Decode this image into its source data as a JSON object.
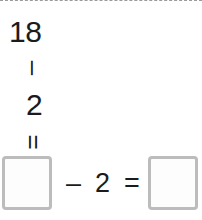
{
  "panel": {
    "title": "subtraction-exercise",
    "accent_color": "#bcbcbc",
    "text_color": "#1b1b1b",
    "divider_color": "#9a9a9a",
    "background_color": "#ffffff"
  },
  "vertical_equation": {
    "minuend": "18",
    "operator_subtract": "–",
    "subtrahend": "2",
    "operator_equals": "=",
    "orientation": "rotated-90"
  },
  "answer_row": {
    "first_box_value": "",
    "first_box_placeholder": "",
    "operator_subtract": "–",
    "subtrahend": "2",
    "operator_equals": "=",
    "second_box_value": "",
    "second_box_placeholder": ""
  }
}
